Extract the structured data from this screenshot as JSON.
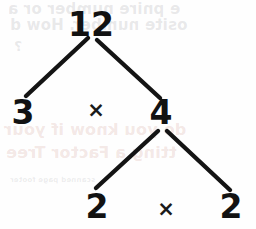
{
  "diagram": {
    "type": "factor-tree",
    "stroke_color": "#141414",
    "text_color": "#121212",
    "background_color": "#fefefe",
    "nodes": {
      "root": "12",
      "level1_left": "3",
      "level1_right": "4",
      "level2_left": "2",
      "level2_right": "2"
    },
    "operators": {
      "top": "×",
      "bottom": "×"
    },
    "branches": [
      {
        "name": "root-to-left",
        "from": [
          88,
          38
        ],
        "to": [
          26,
          96
        ]
      },
      {
        "name": "root-to-right",
        "from": [
          97,
          40
        ],
        "to": [
          160,
          98
        ]
      },
      {
        "name": "four-to-left",
        "from": [
          158,
          131
        ],
        "to": [
          96,
          188
        ]
      },
      {
        "name": "four-to-right",
        "from": [
          167,
          131
        ],
        "to": [
          230,
          190
        ]
      }
    ]
  },
  "background_showthrough": {
    "note": "faint mirrored text bleeding through from the reverse side of the page",
    "lines": [
      "e pnire number or a",
      "osite number. How d",
      "?",
      "do you know if your",
      "tting a Factor Tree",
      "scanned page footer"
    ]
  }
}
